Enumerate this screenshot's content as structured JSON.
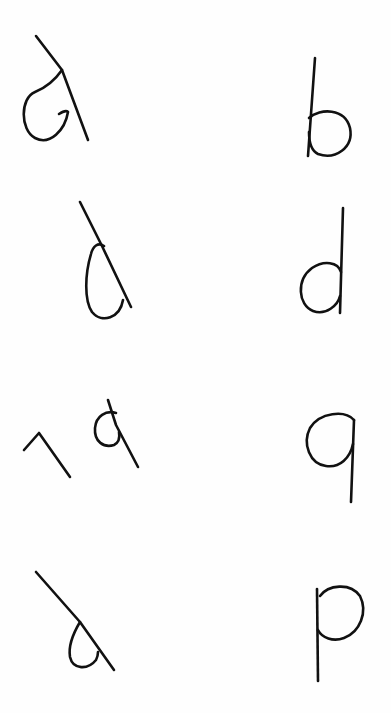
{
  "sheet": {
    "width": 391,
    "height": 713,
    "background": "#fefefe",
    "ink": "#111111"
  },
  "glyphs": [
    {
      "id": "a-rotated",
      "row": 1,
      "col": "left",
      "reading": "d (rotated)",
      "paths": [
        "M36 36 L62 70 L88 140",
        "M62 70 C55 80 45 88 35 92 C20 98 20 130 35 138 C50 146 65 130 68 112 C66 110 62 112 59 114"
      ]
    },
    {
      "id": "b",
      "row": 1,
      "col": "right",
      "reading": "b",
      "paths": [
        "M315 58 L308 156",
        "M309 118 C320 108 345 108 350 128 C354 148 335 160 318 154 C310 150 309 140 309 132"
      ]
    },
    {
      "id": "d-slanted",
      "row": 2,
      "col": "left",
      "reading": "d (slanted)",
      "paths": [
        "M80 202 L102 246 L131 307",
        "M104 246 C98 242 93 246 91 254 C85 274 84 300 92 312 C102 324 120 318 123 300"
      ]
    },
    {
      "id": "d",
      "row": 2,
      "col": "right",
      "reading": "d",
      "paths": [
        "M343 208 L340 313",
        "M341 272 C338 262 324 260 312 268 C296 280 298 305 313 311 C326 316 338 305 340 296"
      ]
    },
    {
      "id": "seven",
      "row": 3,
      "col": "left",
      "reading": "7 (rotated)",
      "paths": [
        "M24 450 L39 433 L70 477"
      ]
    },
    {
      "id": "q-small",
      "row": 3,
      "col": "left",
      "reading": "q (small)",
      "paths": [
        "M108 400 L116 425 L138 467",
        "M116 413 C106 410 96 416 95 428 C94 442 104 448 114 445 C118 443 120 438 119 432"
      ]
    },
    {
      "id": "q",
      "row": 3,
      "col": "right",
      "reading": "q",
      "paths": [
        "M354 420 L351 502",
        "M354 420 C345 410 320 412 310 428 C302 444 310 464 326 466 C340 468 350 458 353 444"
      ]
    },
    {
      "id": "b-rotated",
      "row": 4,
      "col": "left",
      "reading": "b (rotated)",
      "paths": [
        "M36 572 L80 622 L114 670",
        "M80 622 C74 632 68 645 70 657 C73 670 88 670 96 660 C98 656 98 654 98 652"
      ]
    },
    {
      "id": "p",
      "row": 4,
      "col": "right",
      "reading": "p",
      "paths": [
        "M317 589 L318 681",
        "M320 596 C328 585 350 582 360 596 C368 612 360 632 344 638 C333 642 322 638 318 630"
      ]
    }
  ]
}
